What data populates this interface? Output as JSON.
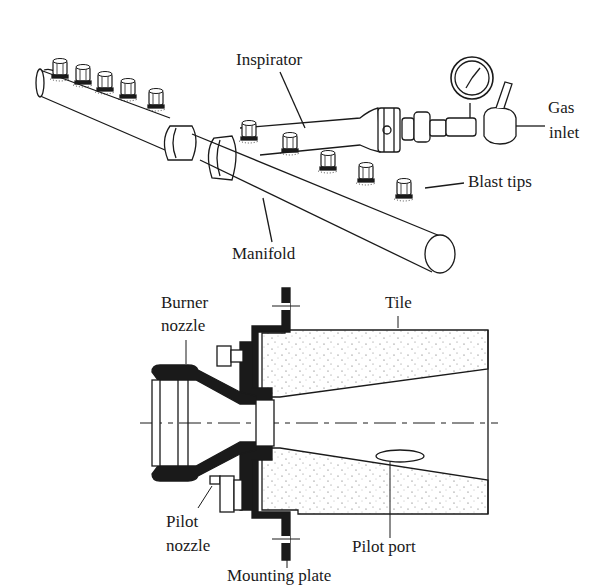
{
  "figure": {
    "top_illustration": {
      "name": "Manifold burner assembly",
      "labels": {
        "inspirator": "Inspirator",
        "gas_inlet_line1": "Gas",
        "gas_inlet_line2": "inlet",
        "blast_tips": "Blast tips",
        "manifold": "Manifold"
      }
    },
    "bottom_illustration": {
      "name": "Burner cross-section",
      "labels": {
        "burner_nozzle_line1": "Burner",
        "burner_nozzle_line2": "nozzle",
        "tile": "Tile",
        "pilot_nozzle_line1": "Pilot",
        "pilot_nozzle_line2": "nozzle",
        "pilot_port": "Pilot port",
        "mounting_plate": "Mounting plate"
      }
    }
  },
  "colors": {
    "ink": "#1a1a1a",
    "background": "#ffffff",
    "stipple": "#555555"
  }
}
